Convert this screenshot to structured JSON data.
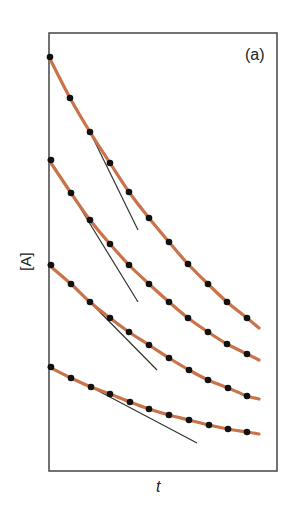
{
  "chart_data": {
    "type": "line",
    "title": "",
    "panel_label": "(a)",
    "xlabel": "t",
    "ylabel": "[A]",
    "grid": false,
    "legend": null,
    "axis_ticks": "none",
    "curve_color": "#c8734a",
    "marker_color": "#111111",
    "tangent_color": "#333333",
    "series": [
      {
        "name": "curve-1",
        "points_px": [
          [
            50,
            57
          ],
          [
            70,
            98
          ],
          [
            90,
            132
          ],
          [
            110,
            163
          ],
          [
            129,
            192
          ],
          [
            149,
            218
          ],
          [
            169,
            242
          ],
          [
            188,
            264
          ],
          [
            208,
            284
          ],
          [
            227,
            302
          ],
          [
            247,
            318
          ]
        ],
        "end_px": [
          259,
          328
        ],
        "tangent_px": [
          [
            90,
            132
          ],
          [
            138,
            230
          ]
        ]
      },
      {
        "name": "curve-2",
        "points_px": [
          [
            51,
            160
          ],
          [
            71,
            193
          ],
          [
            90,
            220
          ],
          [
            110,
            244
          ],
          [
            129,
            265
          ],
          [
            149,
            284
          ],
          [
            169,
            302
          ],
          [
            188,
            318
          ],
          [
            208,
            332
          ],
          [
            227,
            344
          ],
          [
            247,
            354
          ]
        ],
        "end_px": [
          259,
          360
        ],
        "tangent_px": [
          [
            71,
            193
          ],
          [
            138,
            302
          ]
        ]
      },
      {
        "name": "curve-3",
        "points_px": [
          [
            51,
            265
          ],
          [
            71,
            284
          ],
          [
            90,
            302
          ],
          [
            110,
            318
          ],
          [
            129,
            332
          ],
          [
            149,
            345
          ],
          [
            169,
            358
          ],
          [
            189,
            370
          ],
          [
            208,
            380
          ],
          [
            228,
            388
          ],
          [
            247,
            396
          ]
        ],
        "end_px": [
          259,
          399
        ],
        "tangent_px": [
          [
            90,
            302
          ],
          [
            157,
            370
          ]
        ]
      },
      {
        "name": "curve-4",
        "points_px": [
          [
            51,
            367
          ],
          [
            71,
            378
          ],
          [
            91,
            387
          ],
          [
            110,
            394
          ],
          [
            130,
            402
          ],
          [
            149,
            409
          ],
          [
            169,
            415
          ],
          [
            189,
            420
          ],
          [
            209,
            425
          ],
          [
            228,
            429
          ],
          [
            247,
            432
          ]
        ],
        "end_px": [
          259,
          434
        ],
        "tangent_px": [
          [
            91,
            387
          ],
          [
            197,
            443
          ]
        ]
      }
    ],
    "frame_px": {
      "x": 49,
      "y": 33,
      "w": 228,
      "h": 438
    }
  }
}
